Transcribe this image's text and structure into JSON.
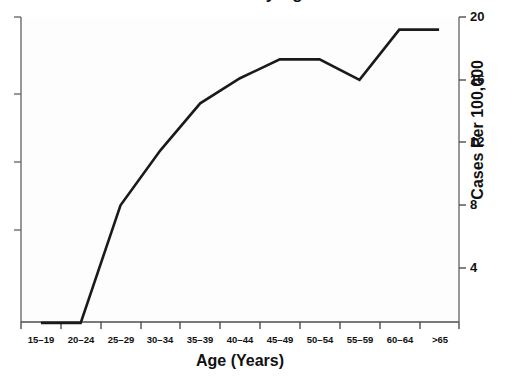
{
  "chart_data": {
    "type": "line",
    "title": "Rate by Age",
    "xlabel": "Age (Years)",
    "ylabel": "Cases Per 100,000",
    "categories": [
      "15–19",
      "20–24",
      "25–29",
      "30–34",
      "35–39",
      "40–44",
      "45–49",
      "50–54",
      "55–59",
      "60–64",
      ">65"
    ],
    "values": [
      0.5,
      0.5,
      8.0,
      11.5,
      14.5,
      16.1,
      17.3,
      17.3,
      16.0,
      19.2,
      19.2
    ],
    "series": [
      {
        "name": "Cases Per 100,000",
        "values": [
          0.5,
          0.5,
          8.0,
          11.5,
          14.5,
          16.1,
          17.3,
          17.3,
          16.0,
          19.2,
          19.2
        ]
      }
    ],
    "ylim": [
      0,
      20
    ],
    "yticks": [
      4,
      8,
      12,
      16,
      20
    ],
    "ytick_labels": [
      "4",
      "8",
      "12",
      "16",
      "20"
    ],
    "y_axis_position": "right",
    "grid": false,
    "legend": false,
    "line_color": "#1a1a1a",
    "line_width": 2.6,
    "plot_background": "#fdfdfd",
    "axis_color": "#4d4d4d"
  },
  "axes": {
    "left_unlabeled_ticks": 4
  }
}
